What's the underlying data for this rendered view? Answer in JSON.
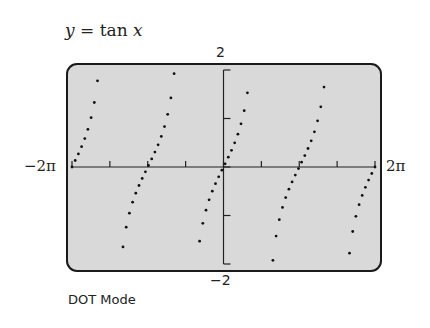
{
  "title": {
    "lhs": "y",
    "eq": " = tan ",
    "var": "x"
  },
  "labels": {
    "ymax": "2",
    "ymin": "−2",
    "xmin": "−2π",
    "xmax": "2π",
    "mode": "DOT Mode"
  },
  "colors": {
    "screen": "#d9d9d9",
    "frame": "#1a1a1a",
    "dots": "#111111"
  },
  "chart_data": {
    "type": "scatter",
    "title": "y = tan x",
    "function": "tan(x)",
    "plot_mode": "DOT",
    "xlim": [
      -6.2832,
      6.2832
    ],
    "ylim": [
      -2,
      2
    ],
    "xlabel": "",
    "ylabel": "",
    "x_tick_labels": [
      "−2π",
      "2π"
    ],
    "y_tick_labels": [
      "−2",
      "2"
    ],
    "x_ticks_spacing": 1.5708,
    "y_ticks_spacing": 1,
    "grid": false,
    "branches": 5,
    "annotation": "DOT Mode"
  }
}
